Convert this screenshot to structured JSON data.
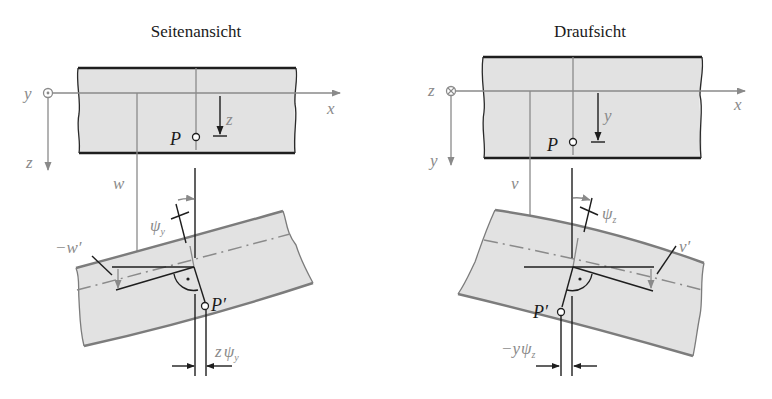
{
  "figure": {
    "left_panel": {
      "title": "Seitenansicht",
      "origin_axis_out_of_plane": "y",
      "origin_symbol": "dot-in-circle (axis pointing toward viewer)",
      "axis_horizontal": "x",
      "axis_vertical": "z",
      "local_axis": "z",
      "point": "P",
      "displacement": "w",
      "rotation": {
        "base": "ψ",
        "sub": "y"
      },
      "slope": "−w′",
      "deformed_point": "P′",
      "offset": {
        "prefix": "z",
        "base": "ψ",
        "sub": "y"
      }
    },
    "right_panel": {
      "title": "Draufsicht",
      "origin_axis_out_of_plane": "z",
      "origin_symbol": "cross-in-circle (axis pointing away from viewer)",
      "axis_horizontal": "x",
      "axis_vertical": "y",
      "local_axis": "y",
      "point": "P",
      "displacement": "v",
      "rotation": {
        "base": "ψ",
        "sub": "z"
      },
      "slope": "v′",
      "deformed_point": "P′",
      "offset": {
        "prefix": "−y",
        "base": "ψ",
        "sub": "z"
      }
    }
  },
  "colors": {
    "beam_fill": "#e2e2e2",
    "dark_line": "#1e1e1e",
    "grey_line": "#8a8a8a"
  }
}
